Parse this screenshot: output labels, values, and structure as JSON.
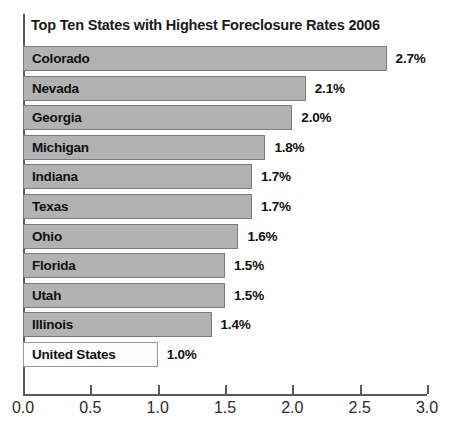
{
  "chart_data": {
    "type": "bar",
    "orientation": "horizontal",
    "title": "Top Ten States with Highest Foreclosure Rates 2006",
    "xlabel": "",
    "ylabel": "",
    "xlim": [
      0.0,
      3.0
    ],
    "grid": false,
    "legend": false,
    "value_suffix": "%",
    "categories": [
      "Colorado",
      "Nevada",
      "Georgia",
      "Michigan",
      "Indiana",
      "Texas",
      "Ohio",
      "Florida",
      "Utah",
      "Illinois",
      "United States"
    ],
    "values": [
      2.7,
      2.1,
      2.0,
      1.8,
      1.7,
      1.7,
      1.6,
      1.5,
      1.5,
      1.4,
      1.0
    ],
    "value_labels": [
      "2.7%",
      "2.1%",
      "2.0%",
      "1.8%",
      "1.7%",
      "1.7%",
      "1.6%",
      "1.5%",
      "1.5%",
      "1.4%",
      "1.0%"
    ],
    "bars": [
      {
        "label": "Colorado",
        "value": 2.7,
        "value_label": "2.7%",
        "benchmark": false
      },
      {
        "label": "Nevada",
        "value": 2.1,
        "value_label": "2.1%",
        "benchmark": false
      },
      {
        "label": "Georgia",
        "value": 2.0,
        "value_label": "2.0%",
        "benchmark": false
      },
      {
        "label": "Michigan",
        "value": 1.8,
        "value_label": "1.8%",
        "benchmark": false
      },
      {
        "label": "Indiana",
        "value": 1.7,
        "value_label": "1.7%",
        "benchmark": false
      },
      {
        "label": "Texas",
        "value": 1.7,
        "value_label": "1.7%",
        "benchmark": false
      },
      {
        "label": "Ohio",
        "value": 1.6,
        "value_label": "1.6%",
        "benchmark": false
      },
      {
        "label": "Florida",
        "value": 1.5,
        "value_label": "1.5%",
        "benchmark": false
      },
      {
        "label": "Utah",
        "value": 1.5,
        "value_label": "1.5%",
        "benchmark": false
      },
      {
        "label": "Illinois",
        "value": 1.4,
        "value_label": "1.4%",
        "benchmark": false
      },
      {
        "label": "United States",
        "value": 1.0,
        "value_label": "1.0%",
        "benchmark": true
      }
    ],
    "xticks": [
      0.0,
      0.5,
      1.0,
      1.5,
      2.0,
      2.5,
      3.0
    ],
    "xtick_labels": [
      "0.0",
      "0.5",
      "1.0",
      "1.5",
      "2.0",
      "2.5",
      "3.0"
    ],
    "colors": {
      "bar_fill": "#b2b2b2",
      "bar_border": "#7d7d7d",
      "benchmark_fill": "#fbfbfb",
      "benchmark_border": "#9a9a9a",
      "axis": "#5a5a5a",
      "title_text": "#1a1a1a",
      "label_text": "#111111",
      "tick_text": "#2b2b2b",
      "background": "#ffffff"
    }
  }
}
